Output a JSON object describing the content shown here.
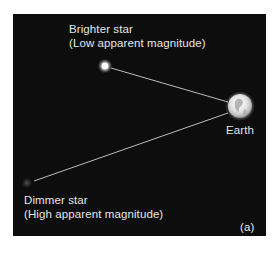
{
  "figure": {
    "panel_label": "(a)",
    "background_color": "#0d0d0d"
  },
  "bright_star": {
    "title": "Brighter star",
    "subtitle": "(Low apparent magnitude)",
    "icon": "bright-star-icon"
  },
  "dim_star": {
    "title": "Dimmer star",
    "subtitle": "(High apparent magnitude)",
    "icon": "dim-star-icon"
  },
  "earth": {
    "label": "Earth",
    "icon": "earth-icon"
  },
  "colors": {
    "text": "#e6e6e6",
    "line": "#cfcfcf",
    "panel": "#0d0d0d",
    "page": "#ffffff"
  }
}
